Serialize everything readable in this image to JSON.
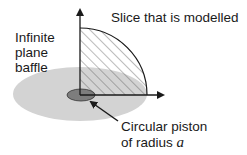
{
  "diagram": {
    "labels": {
      "slice": "Slice that is modelled",
      "baffle_line1": "Infinite",
      "baffle_line2": "plane",
      "baffle_line3": "baffle",
      "piston_line1": "Circular piston",
      "piston_line2_prefix": "of radius ",
      "piston_symbol": "a"
    },
    "colors": {
      "baffle_fill": "#d3d3d3",
      "piston_fill": "#7d7d7d",
      "line": "#1a1a1a",
      "hatch": "#444444"
    }
  }
}
